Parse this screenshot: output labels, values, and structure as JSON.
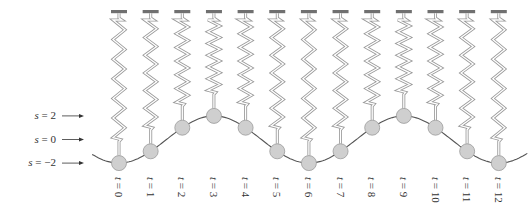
{
  "diagram": {
    "level_labels": [
      {
        "var": "s",
        "text": " = 2",
        "s": 2
      },
      {
        "var": "s",
        "text": " = 0",
        "s": 0
      },
      {
        "var": "s",
        "text": " = −2",
        "s": -2
      }
    ],
    "time_labels": [
      {
        "var": "t",
        "text": " = 0"
      },
      {
        "var": "t",
        "text": " = 1"
      },
      {
        "var": "t",
        "text": " = 2"
      },
      {
        "var": "t",
        "text": " = 3"
      },
      {
        "var": "t",
        "text": " = 4"
      },
      {
        "var": "t",
        "text": " = 5"
      },
      {
        "var": "t",
        "text": " = 6"
      },
      {
        "var": "t",
        "text": " = 7"
      },
      {
        "var": "t",
        "text": " = 8"
      },
      {
        "var": "t",
        "text": " = 9"
      },
      {
        "var": "t",
        "text": " = 10"
      },
      {
        "var": "t",
        "text": " = 11"
      },
      {
        "var": "t",
        "text": " = 12"
      }
    ],
    "positions_s": [
      -2,
      -1,
      1,
      2,
      1,
      -1,
      -2,
      -1,
      1,
      2,
      1,
      -1,
      -2
    ],
    "colors": {
      "mount_bar": "#707070",
      "spring": "#9a9a9a",
      "mass_fill": "#cfcfcf",
      "mass_stroke": "#9a9a9a",
      "curve": "#555555",
      "arrow": "#333333"
    }
  }
}
